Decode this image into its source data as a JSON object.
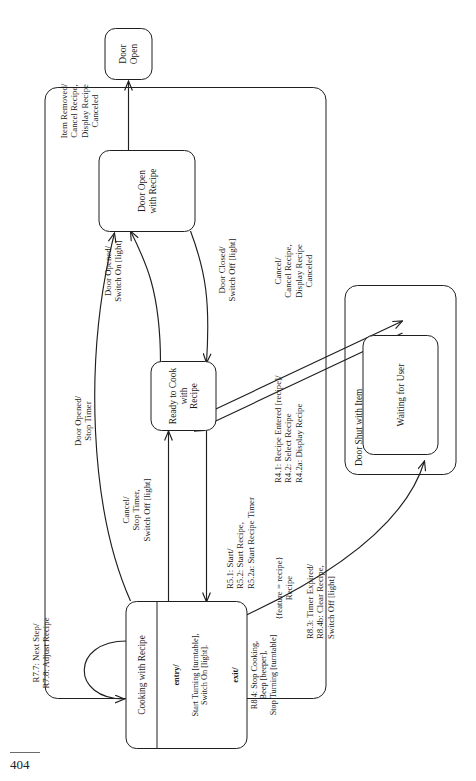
{
  "page": {
    "folio": "404",
    "orientation": "landscape-figure-rotated-90-ccw"
  },
  "diagram": {
    "type": "uml-state-machine"
  },
  "states": {
    "door_open": "Door\nOpen",
    "door_open_with_recipe": "Door Open\nwith Recipe",
    "ready_to_cook": "Ready to Cook\nwith\nRecipe",
    "waiting_for_user": "Waiting for User",
    "cooking_title": "Cooking with Recipe"
  },
  "composites": {
    "recipe": "{feature = recipe}\nRecipe",
    "door_shut_with_item": "Door Shut with Item"
  },
  "cooking_compartments": {
    "entry_keyword": "entry/",
    "entry_actions": "Start Turning [turntable],\nSwitch On [light].",
    "exit_keyword": "exit/",
    "exit_actions": "R8.4: Stop Cooking,\nBeep [beeper],\nStop Turning [turntable]"
  },
  "transitions": {
    "item_removed": "Item Removed/\nCancel Recipe,\nDisplay Recipe\nCanceled",
    "door_closed": "Door Closed/\nSwitch Off [light]",
    "door_opened_light": "Door Opened/\nSwitch On [light]",
    "door_opened_stop_timer": "Door Opened/\nStop Timer",
    "cancel_stop_timer": "Cancel/\nStop Timer,\nSwitch Off [light]",
    "recipe_entered": "R4.1: Recipe Entered [recipe]/\nR4.2: Select Recipe\nR4.2a: Display Recipe",
    "cancel_recipe": "Cancel/\nCancel Recipe,\nDisplay Recipe\nCanceled",
    "start_recipe": "R5.1: Start/\nR5.2: Start Recipe,\nR5.2a: Start Recipe Timer",
    "next_step": "R7.7: Next Step/\nR7.8: Adjust Recipe",
    "timer_expired": "R8.3: Timer Expired/\nR8.4b: Clear Recipe,\nSwitch Off [light]"
  },
  "colors": {
    "ink": "#1f1f1f",
    "paper": "#ffffff",
    "rule": "#6a6a6a"
  }
}
